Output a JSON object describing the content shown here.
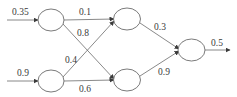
{
  "diagram": {
    "type": "neural-network",
    "colors": {
      "background": "#ffffff",
      "stroke": "#6b6b6b",
      "text": "#3a3a3a"
    },
    "layers": {
      "input": [
        {
          "id": "i1",
          "value": "0.35"
        },
        {
          "id": "i2",
          "value": "0.9"
        }
      ],
      "hidden": [
        {
          "id": "h1"
        },
        {
          "id": "h2"
        }
      ],
      "output": [
        {
          "id": "o1",
          "value": "0.5"
        }
      ]
    },
    "weights": {
      "i1_h1": "0.1",
      "i1_h2": "0.8",
      "i2_h1": "0.4",
      "i2_h2": "0.6",
      "h1_o1": "0.3",
      "h2_o1": "0.9"
    }
  }
}
